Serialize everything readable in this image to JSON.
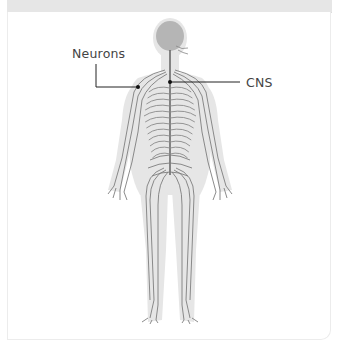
{
  "diagram": {
    "labels": [
      {
        "id": "neurons",
        "text": "Neurons"
      },
      {
        "id": "cns",
        "text": "CNS"
      }
    ]
  },
  "colors": {
    "silhouette": "#e4e4e4",
    "nerves": "#7a7a7a",
    "head": "#b8b8b8",
    "leader": "#222222",
    "label_text": "#444444",
    "header_bar": "#e6e6e6"
  }
}
